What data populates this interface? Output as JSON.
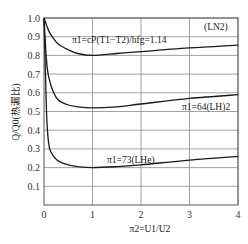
{
  "chart_data": {
    "type": "line",
    "title": "",
    "xlabel": "π2=U1/U2",
    "ylabel": "Q/Q0(热漏比)",
    "xlim": [
      0,
      4
    ],
    "ylim": [
      0,
      1.0
    ],
    "grid": true,
    "x_ticks": [
      "0",
      "1",
      "2",
      "3",
      "4"
    ],
    "y_ticks": [
      "0.1",
      "0.2",
      "0.3",
      "0.4",
      "0.5",
      "0.6",
      "0.7",
      "0.8",
      "0.9",
      "1.0"
    ],
    "series": [
      {
        "name": "π1=cP(T1−T2)/hfg=1.14 (LN2)",
        "annotation": "π1=cP(T1−T2)/hfg=1.14",
        "end_label": "(LN2)",
        "x": [
          0,
          0.1,
          0.2,
          0.3,
          0.5,
          0.7,
          1.0,
          1.5,
          2.0,
          3.0,
          4.0
        ],
        "y": [
          1.0,
          0.93,
          0.89,
          0.86,
          0.83,
          0.81,
          0.8,
          0.81,
          0.82,
          0.84,
          0.855
        ]
      },
      {
        "name": "π1=64(LH)2",
        "annotation": "π1=64(LH)2",
        "x": [
          0,
          0.05,
          0.1,
          0.2,
          0.3,
          0.5,
          0.7,
          1.0,
          1.5,
          2.0,
          3.0,
          4.0
        ],
        "y": [
          1.0,
          0.78,
          0.68,
          0.6,
          0.56,
          0.535,
          0.525,
          0.52,
          0.525,
          0.54,
          0.57,
          0.59
        ]
      },
      {
        "name": "π1=73(LHe)",
        "annotation": "π1=73(LHe)",
        "x": [
          0,
          0.03,
          0.06,
          0.1,
          0.15,
          0.2,
          0.3,
          0.5,
          0.7,
          1.0,
          1.5,
          2.0,
          3.0,
          4.0
        ],
        "y": [
          1.0,
          0.7,
          0.45,
          0.32,
          0.28,
          0.26,
          0.235,
          0.215,
          0.205,
          0.2,
          0.205,
          0.215,
          0.24,
          0.26
        ]
      }
    ]
  },
  "labels": {
    "ylabel": "Q/Q0(热漏比)",
    "xlabel": "π2=U1/U2",
    "ln2_annotation": "π1=cP(T1−T2)/hfg=1.14",
    "ln2_end": "(LN2)",
    "lh2_annotation": "π1=64(LH)2",
    "lhe_annotation": "π1=73(LHe)"
  }
}
